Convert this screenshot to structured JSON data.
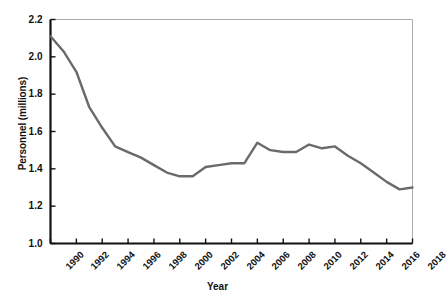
{
  "chart_data": {
    "type": "line",
    "title": "",
    "xlabel": "Year",
    "ylabel": "Personnel (millions)",
    "xlim": [
      1990,
      2018
    ],
    "ylim": [
      1.0,
      2.2
    ],
    "ytick_step": 0.2,
    "xtick_step": 2,
    "grid": false,
    "legend": null,
    "line_color": "#6a6a6a",
    "axis_color": "#111111",
    "frame_color": "#aaaaaa",
    "ytick_labels": [
      "1.0",
      "1.2",
      "1.4",
      "1.6",
      "1.8",
      "2.0",
      "2.2"
    ],
    "ytick_values": [
      1.0,
      1.2,
      1.4,
      1.6,
      1.8,
      2.0,
      2.2
    ],
    "xtick_labels": [
      "1990",
      "1992",
      "1994",
      "1996",
      "1998",
      "2000",
      "2002",
      "2004",
      "2006",
      "2008",
      "2010",
      "2012",
      "2014",
      "2016",
      "2018"
    ],
    "xtick_values": [
      1990,
      1992,
      1994,
      1996,
      1998,
      2000,
      2002,
      2004,
      2006,
      2008,
      2010,
      2012,
      2014,
      2016,
      2018
    ],
    "x": [
      1990,
      1991,
      1992,
      1993,
      1994,
      1995,
      1996,
      1997,
      1998,
      1999,
      2000,
      2001,
      2002,
      2003,
      2004,
      2005,
      2006,
      2007,
      2008,
      2009,
      2010,
      2011,
      2012,
      2013,
      2014,
      2015,
      2016,
      2017,
      2018
    ],
    "values": [
      2.11,
      2.03,
      1.92,
      1.73,
      1.62,
      1.52,
      1.49,
      1.46,
      1.42,
      1.38,
      1.36,
      1.36,
      1.41,
      1.42,
      1.43,
      1.43,
      1.54,
      1.5,
      1.49,
      1.49,
      1.53,
      1.51,
      1.52,
      1.47,
      1.43,
      1.38,
      1.33,
      1.29,
      1.3
    ]
  }
}
